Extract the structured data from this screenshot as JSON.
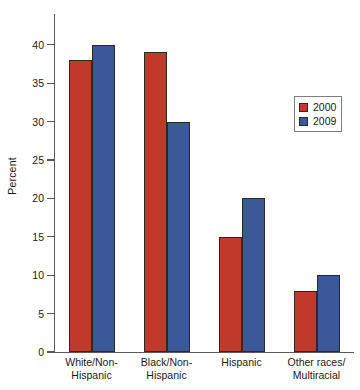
{
  "chart_data": {
    "type": "bar",
    "title": "",
    "subtitle": "",
    "xlabel": "",
    "ylabel": "Percent",
    "categories": [
      "White/Non-Hispanic",
      "Black/Non-Hispanic",
      "Hispanic",
      "Other races/Multiracial"
    ],
    "category_lines": [
      [
        "White/Non-",
        "Hispanic"
      ],
      [
        "Black/Non-",
        "Hispanic"
      ],
      [
        "Hispanic",
        ""
      ],
      [
        "Other races/",
        "Multiracial"
      ]
    ],
    "series": [
      {
        "name": "2000",
        "color": "#C0392B",
        "values": [
          38,
          39,
          15,
          8
        ]
      },
      {
        "name": "2009",
        "color": "#3B5998",
        "values": [
          40,
          30,
          20,
          10
        ]
      }
    ],
    "ylim": [
      0,
      44
    ],
    "yticks": [
      0,
      5,
      10,
      15,
      20,
      25,
      30,
      35,
      40
    ],
    "ytick_labels": [
      "0",
      "5",
      "10",
      "15",
      "20",
      "25",
      "30",
      "35",
      "40"
    ],
    "grid": false,
    "legend_position": "right",
    "legend_entries": [
      "2000",
      "2009"
    ]
  }
}
